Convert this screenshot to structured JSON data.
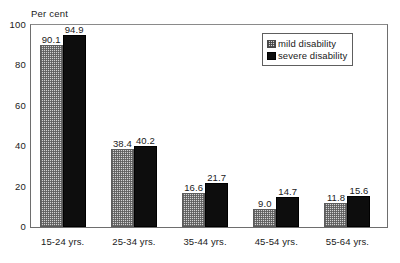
{
  "chart_data": {
    "type": "bar",
    "title": "",
    "subtitle": "",
    "xlabel": "",
    "ylabel": "Per cent",
    "ylim": [
      0,
      100
    ],
    "yticks": [
      "0",
      "20",
      "40",
      "60",
      "80",
      "100"
    ],
    "grid": false,
    "legend_position": "top-right",
    "categories": [
      "15-24 yrs.",
      "25-34 yrs.",
      "35-44 yrs.",
      "45-54 yrs.",
      "55-64 yrs."
    ],
    "series": [
      {
        "name": "mild disability",
        "fill": "checkered-light",
        "color": "#d2d2d2",
        "values": [
          90.1,
          38.4,
          16.6,
          9.0,
          11.8
        ],
        "labels": [
          "90.1",
          "38.4",
          "16.6",
          "9.0",
          "11.8"
        ]
      },
      {
        "name": "severe disability",
        "fill": "solid-black",
        "color": "#0d0d0d",
        "values": [
          94.9,
          40.2,
          21.7,
          14.7,
          15.6
        ],
        "labels": [
          "94.9",
          "40.2",
          "21.7",
          "14.7",
          "15.6"
        ]
      }
    ]
  },
  "legend": {
    "items": [
      {
        "label": "mild disability"
      },
      {
        "label": "severe disability"
      }
    ]
  }
}
